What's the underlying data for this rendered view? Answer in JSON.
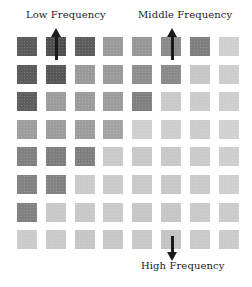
{
  "labels": {
    "low": "Low Frequency",
    "middle": "Middle Frequency",
    "high": "High Frequency"
  },
  "grid": {
    "rows": 8,
    "cols": 8,
    "shades": [
      [
        "#5a5a5a",
        "#4f4f4f",
        "#5c5c5c",
        "#9a9a9a",
        "#979797",
        "#8a8a8a",
        "#7e7e7e",
        "#cfcfcf"
      ],
      [
        "#5b5b5b",
        "#575757",
        "#9a9a9a",
        "#9a9a9a",
        "#8e8e8e",
        "#8a8a8a",
        "#c6c6c6",
        "#cdcdcd"
      ],
      [
        "#5e5e5e",
        "#9c9c9c",
        "#9b9b9b",
        "#9c9c9c",
        "#808080",
        "#c9c9c9",
        "#cbcbcb",
        "#cecece"
      ],
      [
        "#9e9e9e",
        "#9c9c9c",
        "#9c9c9c",
        "#a3a3a3",
        "#cfcfcf",
        "#cdcdcd",
        "#cccccc",
        "#d1d1d1"
      ],
      [
        "#808080",
        "#7e7e7e",
        "#7f7f7f",
        "#c9c9c9",
        "#c8c8c8",
        "#c8c8c8",
        "#cacaca",
        "#cecece"
      ],
      [
        "#828282",
        "#828282",
        "#cbcbcb",
        "#cbcbcb",
        "#c9c9c9",
        "#c8c8c8",
        "#cacaca",
        "#cfcfcf"
      ],
      [
        "#818181",
        "#c8c8c8",
        "#c8c8c8",
        "#c9c9c9",
        "#c6c6c6",
        "#c6c6c6",
        "#c9c9c9",
        "#cbcbcb"
      ],
      [
        "#cbcbcb",
        "#cacaca",
        "#c6c6c6",
        "#c7c7c7",
        "#c8c8c8",
        "#c3c3c3",
        "#c9c9c9",
        "#cbcbcb"
      ]
    ]
  },
  "arrows": [
    {
      "name": "low-frequency-arrow",
      "direction": "up"
    },
    {
      "name": "middle-frequency-arrow",
      "direction": "up"
    },
    {
      "name": "high-frequency-arrow",
      "direction": "down"
    }
  ]
}
